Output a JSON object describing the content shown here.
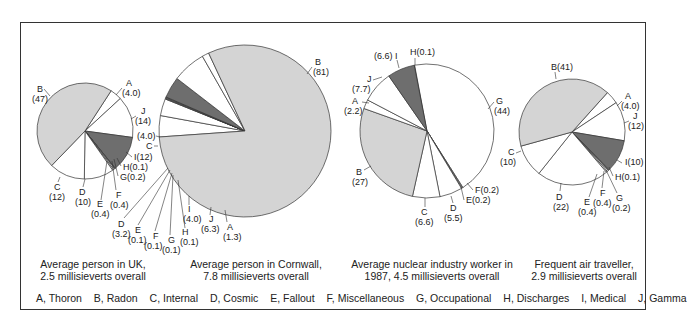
{
  "colors": {
    "radon": "#d4d4d4",
    "medical": "#6e6e6e",
    "other": "#ffffff",
    "stroke": "#333333"
  },
  "captions": [
    {
      "line1": "Average person in UK,",
      "line2": "2.5 millisieverts overall"
    },
    {
      "line1": "Average person in Cornwall,",
      "line2": "7.8 millisieverts overall"
    },
    {
      "line1": "Average nuclear industry worker in",
      "line2": "1987, 4.5 millisieverts overall"
    },
    {
      "line1": "Frequent air traveller,",
      "line2": "2.9 millisieverts overall"
    }
  ],
  "legend": [
    "A, Thoron",
    "B, Radon",
    "C, Internal",
    "D, Cosmic",
    "E, Fallout",
    "F, Miscellaneous",
    "G, Occupational",
    "H, Discharges",
    "I, Medical",
    "J, Gamma"
  ],
  "chart_data": [
    {
      "type": "pie",
      "title": "Average person in UK, 2.5 millisieverts overall",
      "total_mSv": 2.5,
      "categories": [
        "A",
        "B",
        "C",
        "D",
        "E",
        "F",
        "G",
        "H",
        "I",
        "J"
      ],
      "values": [
        4.0,
        47,
        12,
        10,
        0.4,
        0.4,
        0.2,
        0.1,
        12,
        14
      ],
      "unit": "percent"
    },
    {
      "type": "pie",
      "title": "Average person in Cornwall, 7.8 millisieverts overall",
      "total_mSv": 7.8,
      "categories": [
        "A",
        "B",
        "C",
        "D",
        "E",
        "F",
        "G",
        "H",
        "I",
        "J"
      ],
      "values": [
        1.3,
        81,
        4.0,
        3.2,
        0.1,
        0.1,
        0.1,
        0.1,
        4.0,
        6.3
      ],
      "unit": "percent"
    },
    {
      "type": "pie",
      "title": "Average nuclear industry worker in 1987, 4.5 millisieverts overall",
      "total_mSv": 4.5,
      "categories": [
        "A",
        "B",
        "C",
        "D",
        "E",
        "F",
        "G",
        "H",
        "I",
        "J"
      ],
      "values": [
        2.2,
        27,
        6.6,
        5.5,
        0.2,
        0.2,
        44,
        0.1,
        6.6,
        7.7
      ],
      "unit": "percent"
    },
    {
      "type": "pie",
      "title": "Frequent air traveller, 2.9 millisieverts overall",
      "total_mSv": 2.9,
      "categories": [
        "A",
        "B",
        "C",
        "D",
        "E",
        "F",
        "G",
        "H",
        "I",
        "J"
      ],
      "values": [
        4.0,
        41,
        10,
        22,
        0.4,
        0.4,
        0.2,
        0.1,
        10,
        12
      ],
      "unit": "percent"
    }
  ],
  "pies": [
    {
      "cx": 85,
      "cy": 131,
      "r": 48,
      "start": -57,
      "order": [
        {
          "k": "A",
          "v": 4.0
        },
        {
          "k": "J",
          "v": 14
        },
        {
          "k": "I",
          "v": 12
        },
        {
          "k": "H",
          "v": 0.1
        },
        {
          "k": "G",
          "v": 0.2
        },
        {
          "k": "F",
          "v": 0.4
        },
        {
          "k": "E",
          "v": 0.4
        },
        {
          "k": "D",
          "v": 10
        },
        {
          "k": "C",
          "v": 12
        },
        {
          "k": "B",
          "v": 47
        }
      ],
      "labels": [
        {
          "t": "B",
          "x": 37,
          "y": 92
        },
        {
          "t": "(47)",
          "x": 32,
          "y": 102
        },
        {
          "t": "A",
          "x": 126,
          "y": 86
        },
        {
          "t": "(4.0)",
          "x": 122,
          "y": 96
        },
        {
          "t": "J",
          "x": 141,
          "y": 114
        },
        {
          "t": "(14)",
          "x": 135,
          "y": 124
        },
        {
          "t": "I(12)",
          "x": 134,
          "y": 160
        },
        {
          "t": "H(0.1)",
          "x": 123,
          "y": 170
        },
        {
          "t": "G(0.2)",
          "x": 120,
          "y": 180
        },
        {
          "t": "C",
          "x": 54,
          "y": 190
        },
        {
          "t": "(12)",
          "x": 49,
          "y": 200
        },
        {
          "t": "D",
          "x": 79,
          "y": 195
        },
        {
          "t": "(10)",
          "x": 75,
          "y": 205
        },
        {
          "t": "F",
          "x": 116,
          "y": 198
        },
        {
          "t": "(0.4)",
          "x": 110,
          "y": 208
        },
        {
          "t": "E",
          "x": 97,
          "y": 207
        },
        {
          "t": "(0.4)",
          "x": 91,
          "y": 217
        }
      ],
      "leaders": [
        [
          44,
          89,
          50,
          96
        ],
        [
          122,
          88,
          116,
          95
        ],
        [
          136,
          116,
          131,
          119
        ],
        [
          132,
          157,
          126,
          152
        ],
        [
          121,
          166,
          117,
          158
        ],
        [
          118,
          176,
          114,
          159
        ],
        [
          58,
          182,
          60,
          177
        ],
        [
          83,
          187,
          85,
          179
        ],
        [
          116,
          190,
          112,
          161
        ],
        [
          101,
          200,
          107,
          161
        ]
      ]
    },
    {
      "cx": 245,
      "cy": 131,
      "r": 86,
      "start": 176,
      "order": [
        {
          "k": "C",
          "v": 4.0
        },
        {
          "k": "D",
          "v": 3.2
        },
        {
          "k": "E",
          "v": 0.1
        },
        {
          "k": "F",
          "v": 0.1
        },
        {
          "k": "G",
          "v": 0.1
        },
        {
          "k": "H",
          "v": 0.1
        },
        {
          "k": "I",
          "v": 4.0
        },
        {
          "k": "J",
          "v": 6.3
        },
        {
          "k": "A",
          "v": 1.3
        },
        {
          "k": "B",
          "v": 81
        }
      ],
      "labels": [
        {
          "t": "B",
          "x": 315,
          "y": 65
        },
        {
          "t": "(81)",
          "x": 313,
          "y": 75
        },
        {
          "t": "(4.0)",
          "x": 137,
          "y": 139
        },
        {
          "t": "C",
          "x": 146,
          "y": 149
        },
        {
          "t": "D",
          "x": 118,
          "y": 227
        },
        {
          "t": "(3.2)",
          "x": 112,
          "y": 237
        },
        {
          "t": "E",
          "x": 135,
          "y": 233
        },
        {
          "t": "(0.1)",
          "x": 128,
          "y": 243
        },
        {
          "t": "F",
          "x": 153,
          "y": 239
        },
        {
          "t": "(0.1)",
          "x": 144,
          "y": 249
        },
        {
          "t": "G",
          "x": 168,
          "y": 243
        },
        {
          "t": "(0.1)",
          "x": 162,
          "y": 253
        },
        {
          "t": "H",
          "x": 182,
          "y": 235
        },
        {
          "t": "(0.1)",
          "x": 180,
          "y": 245
        },
        {
          "t": "I",
          "x": 188,
          "y": 212
        },
        {
          "t": "(4.0)",
          "x": 183,
          "y": 222
        },
        {
          "t": "J",
          "x": 209,
          "y": 222
        },
        {
          "t": "(6.3)",
          "x": 201,
          "y": 232
        },
        {
          "t": "A",
          "x": 227,
          "y": 230
        },
        {
          "t": "(1.3)",
          "x": 223,
          "y": 240
        }
      ],
      "leaders": [
        [
          312,
          67,
          307,
          74
        ],
        [
          156,
          136,
          160,
          137
        ],
        [
          154,
          146,
          158,
          146
        ],
        [
          124,
          218,
          168,
          168
        ],
        [
          138,
          225,
          170,
          170
        ],
        [
          155,
          231,
          172,
          173
        ],
        [
          170,
          235,
          173,
          175
        ],
        [
          185,
          228,
          178,
          180
        ],
        [
          189,
          205,
          189,
          196
        ],
        [
          210,
          215,
          211,
          207
        ],
        [
          227,
          222,
          225,
          210
        ]
      ]
    },
    {
      "cx": 427,
      "cy": 131,
      "r": 67,
      "start": -101,
      "order": [
        {
          "k": "H",
          "v": 0.1
        },
        {
          "k": "G",
          "v": 44
        },
        {
          "k": "F",
          "v": 0.2
        },
        {
          "k": "E",
          "v": 0.2
        },
        {
          "k": "D",
          "v": 5.5
        },
        {
          "k": "C",
          "v": 6.6
        },
        {
          "k": "B",
          "v": 27
        },
        {
          "k": "A",
          "v": 2.2
        },
        {
          "k": "J",
          "v": 7.7
        },
        {
          "k": "I",
          "v": 6.6
        }
      ],
      "labels": [
        {
          "t": "(6.6) I",
          "x": 374,
          "y": 59
        },
        {
          "t": "H(0.1)",
          "x": 410,
          "y": 55
        },
        {
          "t": "J",
          "x": 367,
          "y": 82
        },
        {
          "t": "(7.7)",
          "x": 352,
          "y": 92
        },
        {
          "t": "A",
          "x": 352,
          "y": 104
        },
        {
          "t": "(2.2)",
          "x": 344,
          "y": 114
        },
        {
          "t": "G",
          "x": 496,
          "y": 104
        },
        {
          "t": "(44)",
          "x": 494,
          "y": 114
        },
        {
          "t": "B",
          "x": 356,
          "y": 175
        },
        {
          "t": "(27)",
          "x": 352,
          "y": 185
        },
        {
          "t": "F(0.2)",
          "x": 475,
          "y": 193
        },
        {
          "t": "E(0.2)",
          "x": 466,
          "y": 203
        },
        {
          "t": "C",
          "x": 421,
          "y": 215
        },
        {
          "t": "(6.6)",
          "x": 415,
          "y": 225
        },
        {
          "t": "D",
          "x": 450,
          "y": 211
        },
        {
          "t": "(5.5)",
          "x": 444,
          "y": 221
        }
      ],
      "leaders": [
        [
          397,
          60,
          399,
          68
        ],
        [
          415,
          58,
          415,
          65
        ],
        [
          373,
          80,
          382,
          77
        ],
        [
          362,
          102,
          369,
          103
        ],
        [
          494,
          102,
          488,
          109
        ],
        [
          364,
          170,
          371,
          166
        ],
        [
          473,
          190,
          467,
          183
        ],
        [
          464,
          200,
          461,
          187
        ],
        [
          425,
          207,
          425,
          198
        ],
        [
          453,
          203,
          451,
          196
        ]
      ]
    },
    {
      "cx": 572,
      "cy": 132,
      "r": 53,
      "start": -48,
      "order": [
        {
          "k": "A",
          "v": 4.0
        },
        {
          "k": "J",
          "v": 12
        },
        {
          "k": "I",
          "v": 10
        },
        {
          "k": "H",
          "v": 0.1
        },
        {
          "k": "G",
          "v": 0.2
        },
        {
          "k": "F",
          "v": 0.4
        },
        {
          "k": "E",
          "v": 0.4
        },
        {
          "k": "D",
          "v": 22
        },
        {
          "k": "C",
          "v": 10
        },
        {
          "k": "B",
          "v": 41
        }
      ],
      "labels": [
        {
          "t": "B(41)",
          "x": 551,
          "y": 70
        },
        {
          "t": "A",
          "x": 625,
          "y": 99
        },
        {
          "t": "(4.0)",
          "x": 621,
          "y": 109
        },
        {
          "t": "J",
          "x": 633,
          "y": 119
        },
        {
          "t": "(12)",
          "x": 628,
          "y": 129
        },
        {
          "t": "C",
          "x": 508,
          "y": 155
        },
        {
          "t": "(10)",
          "x": 500,
          "y": 165
        },
        {
          "t": "I(10)",
          "x": 625,
          "y": 165
        },
        {
          "t": "H(0.1)",
          "x": 615,
          "y": 180
        },
        {
          "t": "D",
          "x": 556,
          "y": 200
        },
        {
          "t": "(22)",
          "x": 553,
          "y": 210
        },
        {
          "t": "F",
          "x": 600,
          "y": 196
        },
        {
          "t": "(0.4)",
          "x": 593,
          "y": 206
        },
        {
          "t": "G",
          "x": 616,
          "y": 201
        },
        {
          "t": "(0.2)",
          "x": 612,
          "y": 211
        },
        {
          "t": "E",
          "x": 584,
          "y": 205
        },
        {
          "t": "(0.4)",
          "x": 578,
          "y": 215
        }
      ],
      "leaders": [
        [
          555,
          72,
          556,
          79
        ],
        [
          622,
          101,
          617,
          106
        ],
        [
          629,
          121,
          624,
          123
        ],
        [
          516,
          153,
          521,
          151
        ],
        [
          622,
          163,
          617,
          160
        ],
        [
          613,
          176,
          609,
          167
        ],
        [
          560,
          191,
          561,
          183
        ],
        [
          602,
          188,
          604,
          171
        ],
        [
          617,
          193,
          606,
          170
        ],
        [
          589,
          197,
          597,
          174
        ]
      ]
    }
  ],
  "caption_pos": [
    {
      "cx": 92,
      "top": 258
    },
    {
      "cx": 256,
      "top": 258
    },
    {
      "cx": 432,
      "top": 258
    },
    {
      "cx": 584,
      "top": 258
    }
  ]
}
